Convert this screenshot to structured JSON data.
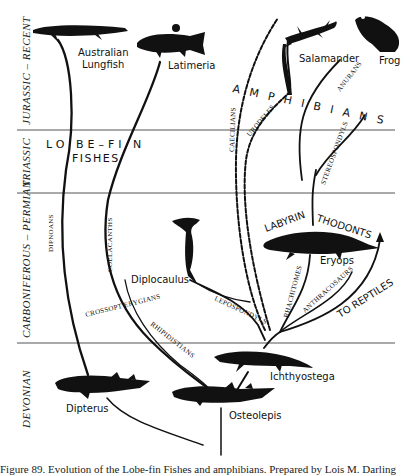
{
  "periods": [
    {
      "label": "JURASSIC – RECENT"
    },
    {
      "label": "TRIASSIC"
    },
    {
      "label": "CARBONIFEROUS – PERMIAN"
    },
    {
      "label": "DEVONIAN"
    }
  ],
  "groups": {
    "lobe_fin": "LO BE–FI N",
    "fishes": "FISHES",
    "amphibians": "A M P H I B I A N S",
    "labyrinthodonts_left": "LABYRIN",
    "labyrinthodonts_right": "THODONTS"
  },
  "lineages": {
    "dipnoans": "DIPNOANS",
    "coelacanths": "COELACANTHS",
    "crossopterygians": "CROSSOPT ERYGIANS",
    "rhipidistians": "RHIPIDISTIANS",
    "lepospondyls": "LEPOSPONDYLS",
    "caecilians": "CAECILIANS",
    "urodeles": "URODELES",
    "anurans": "ANURANS",
    "stereospondyls": "STEREOSPONDYLS",
    "rhachitomes": "RHACHITOMES",
    "anthracosaurs": "ANTHRACOSAURS",
    "to_reptiles": "TO REPTILES"
  },
  "animals": {
    "australian_lungfish_1": "Australian",
    "australian_lungfish_2": "Lungfish",
    "latimeria": "Latimeria",
    "salamander": "Salamander",
    "frog": "Frog",
    "diplocaulus": "Diplocaulus",
    "eryops": "Eryops",
    "ichthyostega": "Ichthyostega",
    "dipterus": "Dipterus",
    "osteolepis": "Osteolepis"
  },
  "caption": "Figure 89. Evolution of the Lobe-fin Fishes and amphibians. Prepared by Lois M. Darling"
}
